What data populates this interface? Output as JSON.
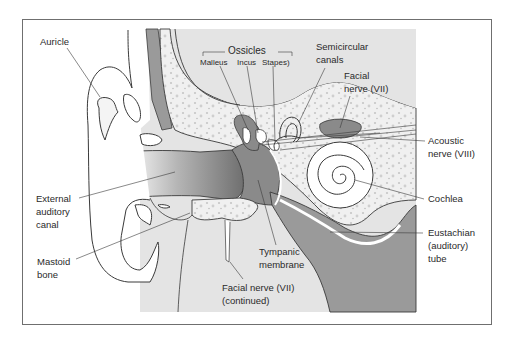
{
  "diagram": {
    "colors": {
      "background": "#ffffff",
      "frame_border": "#6f6f6f",
      "light_gray_region": "#e4e4e4",
      "bone": "#efefef",
      "bone_speckle": "#c4c4c4",
      "dark_gray_region": "#9a9a9a",
      "outline": "#3a3a3a",
      "label_text": "#2a2a2a"
    },
    "labels": {
      "auricle": "Auricle",
      "ossicles_group": "Ossicles",
      "malleus": "Malleus",
      "incus": "Incus",
      "stapes": "Stapes)",
      "semicircular_canals_line1": "Semicircular",
      "semicircular_canals_line2": "canals",
      "facial_nerve_line1": "Facial",
      "facial_nerve_line2": "nerve (VII)",
      "acoustic_nerve_line1": "Acoustic",
      "acoustic_nerve_line2": "nerve (VIII)",
      "cochlea": "Cochlea",
      "eustachian_line1": "Eustachian",
      "eustachian_line2": "(auditory)",
      "eustachian_line3": "tube",
      "external_canal_line1": "External",
      "external_canal_line2": "auditory",
      "external_canal_line3": "canal",
      "mastoid_line1": "Mastoid",
      "mastoid_line2": "bone",
      "tympanic_line1": "Tympanic",
      "tympanic_line2": "membrane",
      "facial_cont_line1": "Facial nerve (VII)",
      "facial_cont_line2": "(continued)"
    }
  }
}
